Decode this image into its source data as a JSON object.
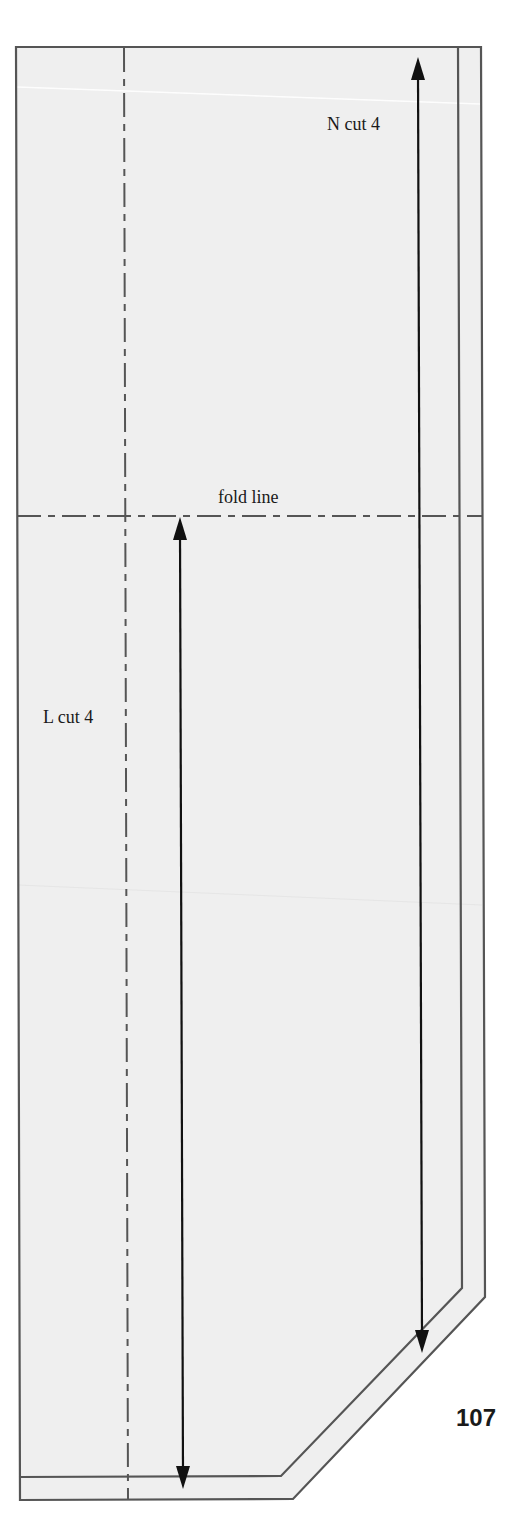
{
  "pattern": {
    "labels": {
      "piece_n": "N cut 4",
      "fold": "fold line",
      "piece_l": "L cut 4"
    },
    "page_number": "107",
    "colors": {
      "paper": "#efefef",
      "outline": "#555555",
      "grainline": "#111111",
      "fold_dash": "#555555",
      "background": "#ffffff"
    }
  }
}
